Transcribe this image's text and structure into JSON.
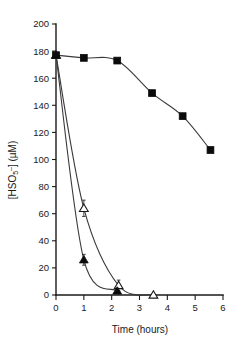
{
  "chart_data": {
    "type": "line",
    "title": "",
    "subtitle": "",
    "xlabel": "Time (hours)",
    "ylabel_parts": {
      "open_bracket": "[HSO",
      "subscript": "5",
      "superscript": "–",
      "close": "] (µM)"
    },
    "ylabel": "[HSO5-] (µM)",
    "xlim": [
      0,
      6
    ],
    "ylim": [
      0,
      200
    ],
    "xticks": [
      0,
      1,
      2,
      3,
      4,
      5,
      6
    ],
    "xticklabels": [
      "0",
      "1",
      "2",
      "3",
      "4",
      "5",
      "6"
    ],
    "yticks": [
      0,
      20,
      40,
      60,
      80,
      100,
      120,
      140,
      160,
      180,
      200
    ],
    "yticklabels": [
      "0",
      "20",
      "40",
      "60",
      "80",
      "100",
      "120",
      "140",
      "160",
      "180",
      "200"
    ],
    "grid": false,
    "legend": "none",
    "series": [
      {
        "name": "filled-square-series",
        "marker": "filled-square",
        "color": "#0b0b0b",
        "x": [
          0.0,
          1.0,
          2.2,
          3.45,
          4.55,
          5.55
        ],
        "y": [
          177,
          175,
          173,
          149,
          132,
          107
        ],
        "errors": [
          0,
          0,
          0,
          0,
          0,
          0
        ]
      },
      {
        "name": "open-triangle-series",
        "marker": "open-triangle",
        "color": "#1a1a1a",
        "x": [
          0.0,
          1.0,
          2.25,
          3.5
        ],
        "y": [
          177,
          64,
          7,
          0
        ],
        "errors": [
          0,
          6,
          4,
          0
        ]
      },
      {
        "name": "filled-triangle-series",
        "marker": "filled-triangle",
        "color": "#0b0b0b",
        "x": [
          0.0,
          1.0,
          2.2
        ],
        "y": [
          177,
          26,
          3
        ],
        "errors": [
          0,
          4,
          2
        ]
      }
    ]
  }
}
